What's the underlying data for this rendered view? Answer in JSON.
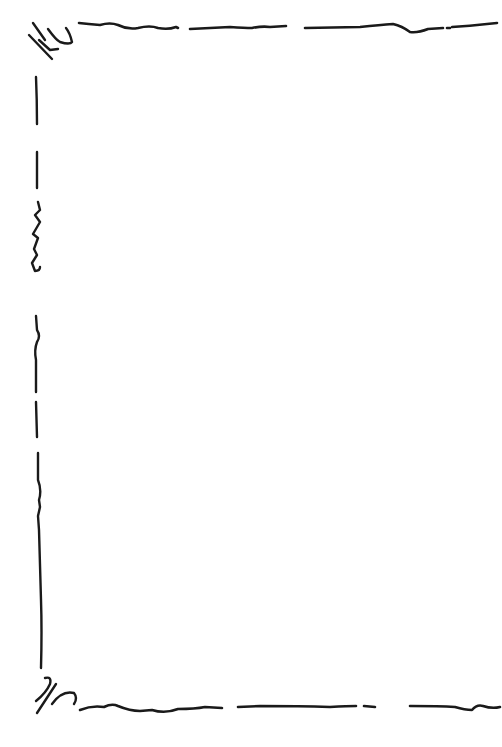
{
  "image": {
    "description": "Hand-drawn black ink decorative page border on white background",
    "width": 502,
    "height": 747
  },
  "colors": {
    "background": "#ffffff",
    "ink": "#1a1a1a"
  },
  "border": {
    "sides_drawn": [
      "top",
      "left",
      "bottom"
    ],
    "right_side_drawn": false,
    "corner_flourishes": [
      "top-left",
      "bottom-left"
    ]
  }
}
